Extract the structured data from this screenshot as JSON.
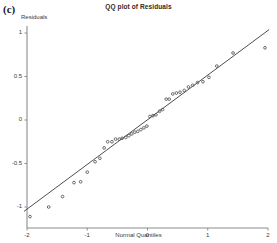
{
  "figure": {
    "panel_label": "(c)",
    "title": "QQ plot of Residuals"
  },
  "axes": {
    "y_title": "Residuals",
    "x_title": "Normal Quantiles"
  },
  "chart_data": {
    "type": "scatter",
    "title": "QQ plot of Residuals",
    "xlabel": "Normal Quantiles",
    "ylabel": "Residuals",
    "xlim": [
      -2.1,
      2.1
    ],
    "ylim": [
      -1.18,
      1.12
    ],
    "xticks": [
      -2,
      -1,
      0,
      1,
      2
    ],
    "xticklabels": [
      "-2",
      "-1",
      "0",
      "1",
      "2"
    ],
    "yticks": [
      -1,
      -0.5,
      0,
      0.5,
      1
    ],
    "yticklabels": [
      "-1",
      "-0.5",
      "0",
      "0.5",
      "1"
    ],
    "grid": false,
    "legend": null,
    "marker": "open-circle",
    "marker_color": "#555555",
    "line_color": "#3a3a3a",
    "reference_line": {
      "label": "theoretical normal reference line",
      "x": [
        -2.05,
        2.02
      ],
      "y": [
        -1.05,
        1.04
      ],
      "slope": 0.5135,
      "intercept": 0.0026
    },
    "points": [
      {
        "x": -1.95,
        "y": -1.11
      },
      {
        "x": -1.64,
        "y": -1.0
      },
      {
        "x": -1.41,
        "y": -0.88
      },
      {
        "x": -1.22,
        "y": -0.72
      },
      {
        "x": -1.11,
        "y": -0.71
      },
      {
        "x": -1.0,
        "y": -0.6
      },
      {
        "x": -0.87,
        "y": -0.48
      },
      {
        "x": -0.79,
        "y": -0.44
      },
      {
        "x": -0.72,
        "y": -0.32
      },
      {
        "x": -0.66,
        "y": -0.25
      },
      {
        "x": -0.59,
        "y": -0.25
      },
      {
        "x": -0.53,
        "y": -0.22
      },
      {
        "x": -0.47,
        "y": -0.22
      },
      {
        "x": -0.42,
        "y": -0.21
      },
      {
        "x": -0.36,
        "y": -0.2
      },
      {
        "x": -0.31,
        "y": -0.18
      },
      {
        "x": -0.26,
        "y": -0.16
      },
      {
        "x": -0.21,
        "y": -0.14
      },
      {
        "x": -0.16,
        "y": -0.13
      },
      {
        "x": -0.11,
        "y": -0.11
      },
      {
        "x": -0.06,
        "y": -0.09
      },
      {
        "x": -0.01,
        "y": -0.07
      },
      {
        "x": 0.04,
        "y": 0.04
      },
      {
        "x": 0.09,
        "y": 0.05
      },
      {
        "x": 0.14,
        "y": 0.06
      },
      {
        "x": 0.2,
        "y": 0.1
      },
      {
        "x": 0.25,
        "y": 0.12
      },
      {
        "x": 0.31,
        "y": 0.24
      },
      {
        "x": 0.36,
        "y": 0.24
      },
      {
        "x": 0.42,
        "y": 0.3
      },
      {
        "x": 0.48,
        "y": 0.31
      },
      {
        "x": 0.54,
        "y": 0.32
      },
      {
        "x": 0.61,
        "y": 0.34
      },
      {
        "x": 0.68,
        "y": 0.38
      },
      {
        "x": 0.75,
        "y": 0.4
      },
      {
        "x": 0.83,
        "y": 0.43
      },
      {
        "x": 0.92,
        "y": 0.44
      },
      {
        "x": 1.02,
        "y": 0.49
      },
      {
        "x": 1.15,
        "y": 0.62
      },
      {
        "x": 1.42,
        "y": 0.77
      },
      {
        "x": 1.95,
        "y": 0.83
      }
    ]
  }
}
